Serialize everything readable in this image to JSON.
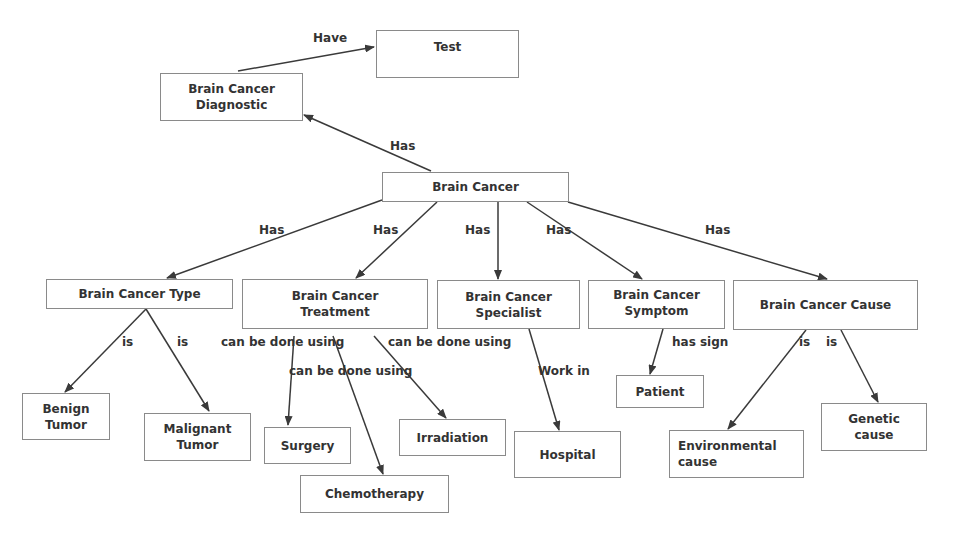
{
  "diagram": {
    "nodes": {
      "test": {
        "line1": "Test",
        "line2": ""
      },
      "diagnostic": {
        "line1": "Brain Cancer",
        "line2": "Diagnostic"
      },
      "brain_cancer": {
        "line1": "Brain Cancer",
        "line2": ""
      },
      "type": {
        "line1": "Brain Cancer Type",
        "line2": ""
      },
      "treatment": {
        "line1": "Brain Cancer",
        "line2": "Treatment"
      },
      "specialist": {
        "line1": "Brain Cancer",
        "line2": "Specialist"
      },
      "symptom": {
        "line1": "Brain Cancer",
        "line2": "Symptom"
      },
      "cause": {
        "line1": "Brain Cancer Cause",
        "line2": ""
      },
      "benign": {
        "line1": "Benign",
        "line2": "Tumor"
      },
      "malignant": {
        "line1": "Malignant",
        "line2": "Tumor"
      },
      "surgery": {
        "line1": "Surgery",
        "line2": ""
      },
      "irradiation": {
        "line1": "Irradiation",
        "line2": ""
      },
      "chemotherapy": {
        "line1": "Chemotherapy",
        "line2": ""
      },
      "hospital": {
        "line1": "Hospital",
        "line2": ""
      },
      "patient": {
        "line1": "Patient",
        "line2": ""
      },
      "environmental": {
        "line1": "Environmental",
        "line2": "cause"
      },
      "genetic": {
        "line1": "Genetic",
        "line2": "cause"
      }
    },
    "edge_labels": {
      "have_test": "Have",
      "has_diagnostic": "Has",
      "has_type": "Has",
      "has_treatment": "Has",
      "has_specialist": "Has",
      "has_symptom": "Has",
      "has_cause": "Has",
      "is_benign": "is",
      "is_malignant": "is",
      "using_surgery": "can be done using",
      "using_chemo": "can be done using",
      "using_irradiation": "can be done using",
      "work_in": "Work in",
      "has_sign": "has sign",
      "is_environmental": "is",
      "is_genetic": "is"
    },
    "colors": {
      "line": "#3a3a3a",
      "border": "#8a8a8a",
      "text": "#333333"
    }
  }
}
